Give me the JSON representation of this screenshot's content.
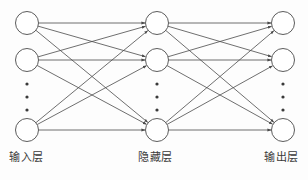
{
  "diagram": {
    "type": "neural-network",
    "title": "",
    "background_color": "#fdfdfd",
    "edge_color": "#4a4a4a",
    "node_fill": "#ffffff",
    "node_stroke": "#4a4a4a",
    "ellipsis_color": "#3a3a3a",
    "edge_direction": "into-node",
    "fully_connected": true,
    "labels": {
      "input_layer": "输入层",
      "hidden_layer": "隐藏层",
      "output_layer": "输出层"
    },
    "layers": [
      {
        "name": "input-layer",
        "label": "输入层",
        "x": 27,
        "node_count_shown": 3,
        "truncated": true,
        "nodes": [
          {
            "id": "i1",
            "cx": 27,
            "cy": 23,
            "r": 11.5
          },
          {
            "id": "i2",
            "cx": 27,
            "cy": 60,
            "r": 11.5
          },
          {
            "id": "i3",
            "cx": 27,
            "cy": 130,
            "r": 11.5
          }
        ],
        "ellipsis": {
          "cx": 27,
          "cy_start": 84,
          "cy_step": 13,
          "count": 3,
          "r": 1.6
        }
      },
      {
        "name": "hidden-layer",
        "label": "隐藏层",
        "x": 157,
        "node_count_shown": 3,
        "truncated": true,
        "nodes": [
          {
            "id": "h1",
            "cx": 157,
            "cy": 23,
            "r": 11.5
          },
          {
            "id": "h2",
            "cx": 157,
            "cy": 60,
            "r": 11.5
          },
          {
            "id": "h3",
            "cx": 157,
            "cy": 130,
            "r": 11.5
          }
        ],
        "ellipsis": {
          "cx": 157,
          "cy_start": 84,
          "cy_step": 13,
          "count": 3,
          "r": 1.6
        }
      },
      {
        "name": "output-layer",
        "label": "输出层",
        "x": 283,
        "node_count_shown": 3,
        "truncated": true,
        "nodes": [
          {
            "id": "o1",
            "cx": 283,
            "cy": 23,
            "r": 11.5
          },
          {
            "id": "o2",
            "cx": 283,
            "cy": 60,
            "r": 11.5
          },
          {
            "id": "o3",
            "cx": 283,
            "cy": 130,
            "r": 11.5
          }
        ],
        "ellipsis": {
          "cx": 283,
          "cy_start": 84,
          "cy_step": 13,
          "count": 3,
          "r": 1.6
        }
      }
    ],
    "edges": [
      {
        "from": "i1",
        "to": "h1"
      },
      {
        "from": "i1",
        "to": "h2"
      },
      {
        "from": "i1",
        "to": "h3"
      },
      {
        "from": "i2",
        "to": "h1"
      },
      {
        "from": "i2",
        "to": "h2"
      },
      {
        "from": "i2",
        "to": "h3"
      },
      {
        "from": "i3",
        "to": "h1"
      },
      {
        "from": "i3",
        "to": "h2"
      },
      {
        "from": "i3",
        "to": "h3"
      },
      {
        "from": "h1",
        "to": "o1"
      },
      {
        "from": "h1",
        "to": "o2"
      },
      {
        "from": "h1",
        "to": "o3"
      },
      {
        "from": "h2",
        "to": "o1"
      },
      {
        "from": "h2",
        "to": "o2"
      },
      {
        "from": "h2",
        "to": "o3"
      },
      {
        "from": "h3",
        "to": "o1"
      },
      {
        "from": "h3",
        "to": "o2"
      },
      {
        "from": "h3",
        "to": "o3"
      }
    ]
  }
}
